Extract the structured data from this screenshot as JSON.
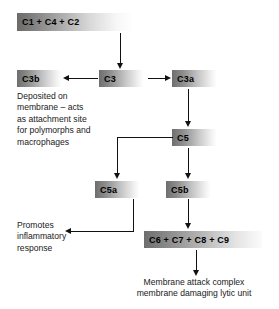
{
  "diagram": {
    "nodes": {
      "c1c4c2": "C1 + C4 + C2",
      "c3b": "C3b",
      "c3": "C3",
      "c3a": "C3a",
      "c5": "C5",
      "c5a": "C5a",
      "c5b": "C5b",
      "c6c7c8c9": "C6 + C7 + C8 + C9"
    },
    "annotations": {
      "c3b_note": "Deposited on\nmembrane – acts\nas attachment site\nfor polymorphs and\nmacrophages",
      "c5a_note": "Promotes\ninflammatory\nresponse",
      "mac_note": "Membrane attack complex\nmembrane damaging lytic unit"
    },
    "colors": {
      "node_gradient_start": "#6e6e6e",
      "node_gradient_end": "#fdfdfd",
      "line": "#111111",
      "text": "#1a1a1a",
      "background": "#ffffff"
    }
  }
}
